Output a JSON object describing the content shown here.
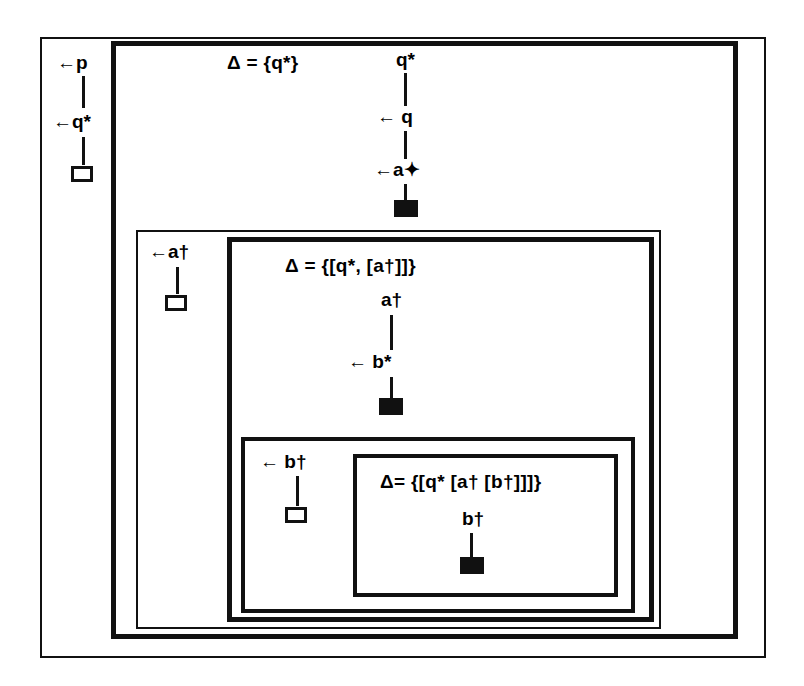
{
  "diagram": {
    "ink_color": "#111111",
    "background": "#ffffff"
  },
  "levels": [
    {
      "id": "level-1",
      "delta_label": "Δ = {q*}",
      "left_chain": {
        "top_label": "←p",
        "mid_label": "←q*",
        "terminal": "open-square"
      },
      "center_chain": {
        "nodes": [
          "q*",
          "← q",
          "←a✦"
        ],
        "terminal": "filled-square"
      }
    },
    {
      "id": "level-2",
      "left_chain": {
        "top_label": "←a†",
        "terminal": "open-square"
      }
    },
    {
      "id": "level-3",
      "delta_label": "Δ = {[q*, [a†]]}",
      "center_chain": {
        "nodes": [
          "a†",
          "← b*"
        ],
        "terminal": "filled-square"
      }
    },
    {
      "id": "level-4",
      "left_chain": {
        "top_label": "← b†",
        "terminal": "open-square"
      }
    },
    {
      "id": "level-5",
      "delta_label": "Δ= {[q* [a† [b†]]]}",
      "center_chain": {
        "nodes": [
          "b†"
        ],
        "terminal": "filled-square"
      }
    }
  ]
}
